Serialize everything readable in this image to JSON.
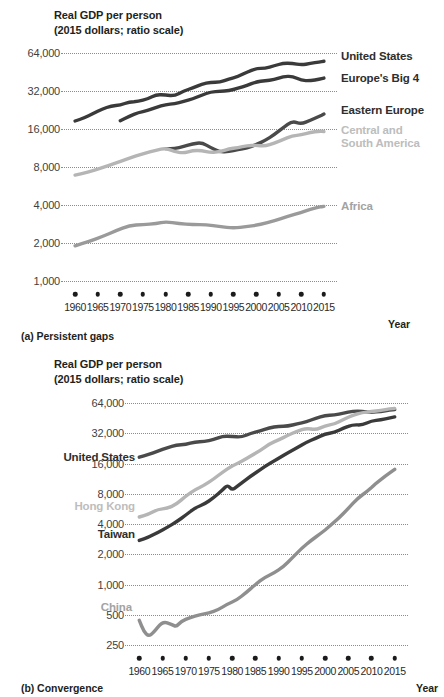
{
  "figure": {
    "panels": [
      {
        "id": "a",
        "caption": "(a) Persistent gaps",
        "axis_title": "Real GDP per person\n(2015 dollars; ratio scale)",
        "xlabel": "Year"
      },
      {
        "id": "b",
        "caption": "(b) Convergence",
        "axis_title": "Real GDP per person\n(2015 dollars; ratio scale)",
        "xlabel": "Year"
      }
    ]
  },
  "colors": {
    "dark": "#3a3a3a",
    "mid": "#6f6f6f",
    "light": "#b5b5b5",
    "grid": "#8c8c8c",
    "text": "#231f20"
  },
  "chart_data": [
    {
      "type": "line",
      "id": "a",
      "title": "Real GDP per person",
      "subtitle": "(2015 dollars; ratio scale)",
      "caption": "(a) Persistent gaps",
      "xlabel": "Year",
      "ylabel": "Real GDP per person (2015 dollars; ratio scale)",
      "scale": "log",
      "grid": true,
      "legend": "inline-right",
      "xlim": [
        1958,
        2017
      ],
      "ylim": [
        1000,
        64000
      ],
      "yticks": [
        1000,
        2000,
        4000,
        8000,
        16000,
        32000,
        64000
      ],
      "ytick_labels": [
        "1,000",
        "2,000",
        "4,000",
        "8,000",
        "16,000",
        "32,000",
        "64,000"
      ],
      "xticks": [
        1960,
        1965,
        1970,
        1975,
        1980,
        1985,
        1990,
        1995,
        2000,
        2005,
        2010,
        2015
      ],
      "xtick_labels": [
        "1960",
        "1965",
        "1970",
        "1975",
        "1980",
        "1985",
        "1990",
        "1995",
        "2000",
        "2005",
        "2010",
        "2015"
      ],
      "series": [
        {
          "name": "United States",
          "color": "#3a3a3a",
          "label_pos": "right",
          "x": [
            1960,
            1962,
            1964,
            1966,
            1968,
            1970,
            1972,
            1974,
            1976,
            1978,
            1980,
            1982,
            1984,
            1986,
            1988,
            1990,
            1992,
            1994,
            1996,
            1998,
            2000,
            2002,
            2004,
            2006,
            2008,
            2010,
            2012,
            2014,
            2015
          ],
          "y": [
            18500,
            19600,
            21200,
            23000,
            24400,
            24700,
            26300,
            26400,
            27700,
            30000,
            29700,
            29300,
            32000,
            33800,
            36200,
            37600,
            37600,
            39800,
            41600,
            45200,
            48200,
            48400,
            50600,
            53200,
            53000,
            51500,
            52800,
            54400,
            55000
          ]
        },
        {
          "name": "Europe's Big 4",
          "color": "#3a3a3a",
          "label_pos": "right",
          "x": [
            1970,
            1972,
            1974,
            1976,
            1978,
            1980,
            1982,
            1984,
            1986,
            1988,
            1990,
            1992,
            1994,
            1996,
            1998,
            2000,
            2002,
            2004,
            2006,
            2008,
            2010,
            2012,
            2014,
            2015
          ],
          "y": [
            18600,
            20200,
            21600,
            22400,
            23800,
            25000,
            25400,
            26400,
            27700,
            29700,
            31500,
            31800,
            32200,
            33600,
            35400,
            37800,
            38600,
            39300,
            41600,
            42000,
            38800,
            38600,
            39600,
            40500
          ]
        },
        {
          "name": "Eastern Europe",
          "color": "#4a4a4a",
          "label_pos": "right",
          "x": [
            1980,
            1982,
            1984,
            1986,
            1988,
            1990,
            1992,
            1994,
            1996,
            1998,
            2000,
            2002,
            2004,
            2006,
            2008,
            2010,
            2012,
            2014,
            2015
          ],
          "y": [
            11200,
            11200,
            11600,
            12200,
            12500,
            11400,
            10500,
            10600,
            11000,
            11300,
            12000,
            13000,
            14400,
            16400,
            18500,
            17500,
            18800,
            20200,
            21000
          ]
        },
        {
          "name": "Central and\nSouth America",
          "color": "#b5b5b5",
          "label_pos": "right",
          "x": [
            1960,
            1963,
            1966,
            1969,
            1972,
            1975,
            1978,
            1980,
            1982,
            1984,
            1986,
            1988,
            1990,
            1992,
            1994,
            1996,
            1998,
            2000,
            2002,
            2004,
            2006,
            2008,
            2010,
            2012,
            2014,
            2015
          ],
          "y": [
            6900,
            7300,
            7900,
            8600,
            9400,
            10200,
            10900,
            11300,
            10600,
            10300,
            10800,
            10800,
            10400,
            10600,
            11100,
            11400,
            11800,
            11900,
            11700,
            12400,
            13200,
            14100,
            14400,
            15000,
            15400,
            15300
          ]
        },
        {
          "name": "Africa",
          "color": "#9a9a9a",
          "label_pos": "right",
          "x": [
            1960,
            1963,
            1966,
            1969,
            1972,
            1975,
            1978,
            1980,
            1983,
            1986,
            1989,
            1992,
            1995,
            1998,
            2001,
            2004,
            2007,
            2010,
            2012,
            2014,
            2015
          ],
          "y": [
            1900,
            2050,
            2250,
            2500,
            2750,
            2800,
            2850,
            2950,
            2850,
            2800,
            2800,
            2700,
            2620,
            2700,
            2800,
            3000,
            3250,
            3500,
            3700,
            3850,
            3900
          ]
        }
      ]
    },
    {
      "type": "line",
      "id": "b",
      "title": "Real GDP per person",
      "subtitle": "(2015 dollars; ratio scale)",
      "caption": "(b) Convergence",
      "xlabel": "Year",
      "ylabel": "Real GDP per person (2015 dollars; ratio scale)",
      "scale": "log",
      "grid": true,
      "legend": "inline-left",
      "xlim": [
        1958,
        2017
      ],
      "ylim": [
        250,
        64000
      ],
      "yticks": [
        250,
        500,
        1000,
        2000,
        4000,
        8000,
        16000,
        32000,
        64000
      ],
      "ytick_labels": [
        "250",
        "500",
        "1,000",
        "2,000",
        "4,000",
        "8,000",
        "16,000",
        "32,000",
        "64,000"
      ],
      "xticks": [
        1960,
        1965,
        1970,
        1975,
        1980,
        1985,
        1990,
        1995,
        2000,
        2005,
        2010,
        2015
      ],
      "xtick_labels": [
        "1960",
        "1965",
        "1970",
        "1975",
        "1980",
        "1985",
        "1990",
        "1995",
        "2000",
        "2005",
        "2010",
        "2015"
      ],
      "series": [
        {
          "name": "United States",
          "color": "#4a4a4a",
          "label_pos": "left",
          "x": [
            1960,
            1962,
            1964,
            1966,
            1968,
            1970,
            1972,
            1974,
            1976,
            1978,
            1980,
            1982,
            1984,
            1986,
            1988,
            1990,
            1992,
            1994,
            1996,
            1998,
            2000,
            2002,
            2004,
            2006,
            2008,
            2010,
            2012,
            2014,
            2015
          ],
          "y": [
            18500,
            19600,
            21200,
            23000,
            24400,
            24700,
            26300,
            26400,
            27700,
            30000,
            29700,
            29300,
            32000,
            33800,
            36200,
            37600,
            37600,
            39800,
            41600,
            45200,
            48200,
            48400,
            50600,
            53200,
            53000,
            51500,
            52800,
            54400,
            55000
          ]
        },
        {
          "name": "Hong Kong",
          "color": "#b5b5b5",
          "label_pos": "left",
          "x": [
            1960,
            1962,
            1964,
            1966,
            1968,
            1970,
            1972,
            1974,
            1976,
            1978,
            1980,
            1982,
            1984,
            1986,
            1988,
            1990,
            1992,
            1994,
            1996,
            1998,
            2000,
            2002,
            2004,
            2006,
            2008,
            2010,
            2012,
            2014,
            2015
          ],
          "y": [
            4700,
            5000,
            5600,
            5700,
            6300,
            7600,
            8800,
            9700,
            11200,
            13200,
            15200,
            16700,
            19000,
            21500,
            25000,
            27500,
            30500,
            33500,
            36000,
            34500,
            38000,
            39500,
            44000,
            48500,
            51500,
            52500,
            54000,
            56000,
            56500
          ]
        },
        {
          "name": "Taiwan",
          "color": "#3a3a3a",
          "label_pos": "left",
          "x": [
            1960,
            1962,
            1964,
            1966,
            1968,
            1970,
            1972,
            1974,
            1976,
            1978,
            1979,
            1980,
            1981,
            1982,
            1984,
            1986,
            1988,
            1990,
            1992,
            1994,
            1996,
            1998,
            2000,
            2002,
            2004,
            2006,
            2008,
            2010,
            2012,
            2014,
            2015
          ],
          "y": [
            2750,
            2950,
            3300,
            3700,
            4200,
            4900,
            5800,
            6300,
            7300,
            8800,
            9800,
            8700,
            9400,
            10200,
            12000,
            13800,
            16000,
            18000,
            20500,
            23000,
            26000,
            28500,
            31500,
            32500,
            36000,
            39000,
            38500,
            42500,
            43500,
            45500,
            46500
          ]
        },
        {
          "name": "China",
          "color": "#8f8f8f",
          "label_pos": "left",
          "x": [
            1960,
            1961,
            1962,
            1963,
            1965,
            1967,
            1968,
            1969,
            1971,
            1973,
            1975,
            1977,
            1979,
            1981,
            1983,
            1985,
            1987,
            1989,
            1991,
            1993,
            1995,
            1997,
            1999,
            2001,
            2003,
            2005,
            2007,
            2009,
            2011,
            2013,
            2015
          ],
          "y": [
            440,
            340,
            305,
            330,
            430,
            400,
            380,
            430,
            470,
            500,
            520,
            560,
            640,
            700,
            830,
            1000,
            1180,
            1300,
            1500,
            1850,
            2300,
            2750,
            3200,
            3800,
            4600,
            5700,
            7200,
            8400,
            10200,
            12000,
            14000
          ]
        }
      ]
    }
  ]
}
